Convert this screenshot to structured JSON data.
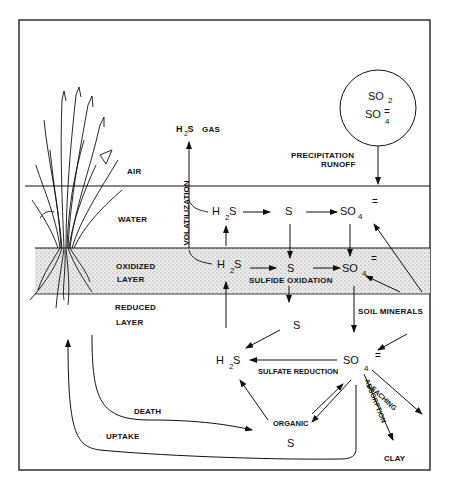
{
  "layers": {
    "air": "AIR",
    "water": "WATER",
    "oxidized": [
      "OXIDIZED",
      "LAYER"
    ],
    "reduced": [
      "REDUCED",
      "LAYER"
    ]
  },
  "atmosphere": {
    "circle_line1": "SO",
    "circle_line1_sub": "2",
    "circle_line2": "SO",
    "circle_line2_sub": "4",
    "circle_line2_charge": "=",
    "precip_label_1": "PRECIPITATION",
    "precip_label_2": "RUNOFF",
    "h2s_gas": "GAS"
  },
  "species": {
    "h2s": "H",
    "h2s_sub": "2",
    "h2s_s": "S",
    "s": "S",
    "so4": "SO",
    "so4_sub": "4",
    "so4_charge": "="
  },
  "processes": {
    "volatilization": "VOLATILIZATION",
    "sulfide_oxidation": "SULFIDE OXIDATION",
    "soil_minerals": "SOIL MINERALS",
    "sulfate_reduction": "SULFATE REDUCTION",
    "leaching": "LEACHING",
    "adsorption": "ADSORPTION",
    "clay": "CLAY",
    "organic": "ORGANIC",
    "organic_s": "S",
    "death": "DEATH",
    "uptake": "UPTAKE"
  },
  "colors": {
    "ink": "#111111",
    "background": "#ffffff",
    "stipple": "#e6e6e6"
  }
}
